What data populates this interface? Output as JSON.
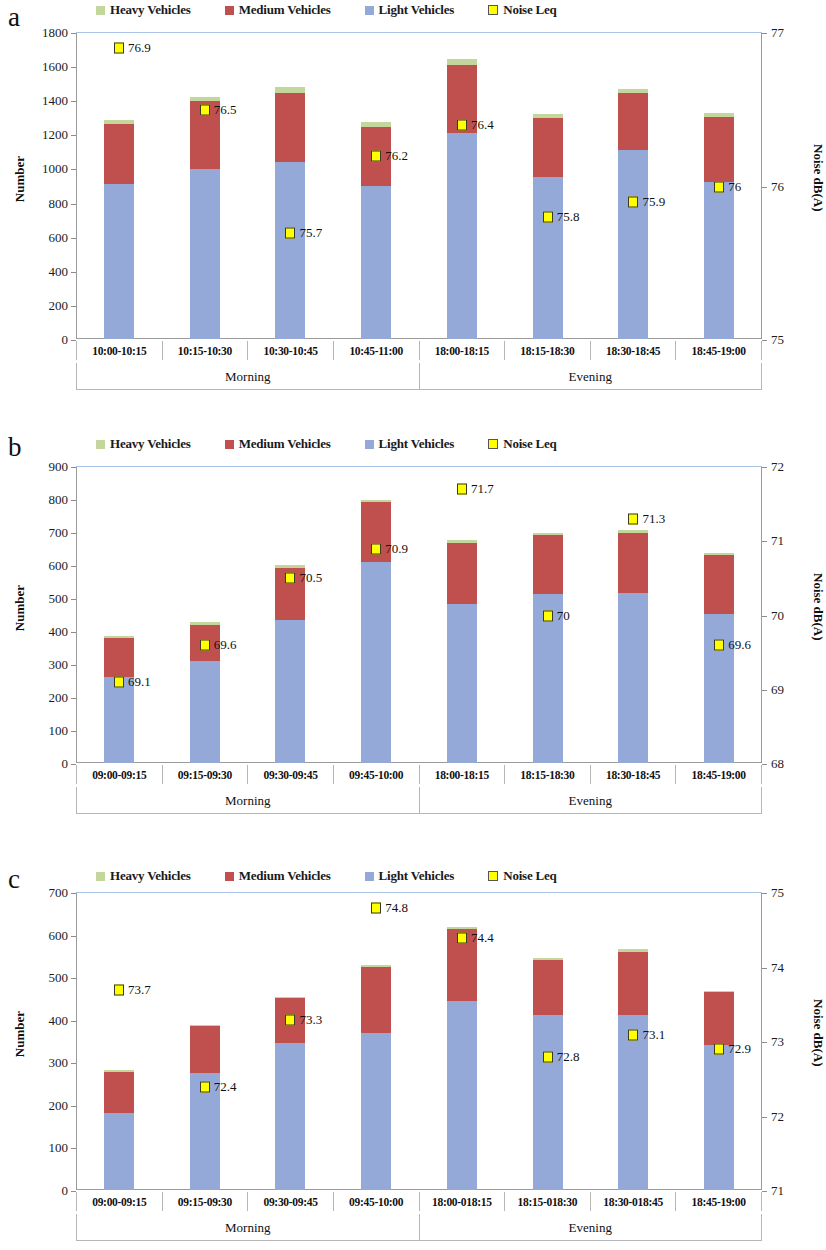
{
  "legend": {
    "items": [
      {
        "label": "Heavy Vehicles",
        "key": "heavy",
        "color": "#c3d69b"
      },
      {
        "label": "Medium Vehicles",
        "key": "medium",
        "color": "#c0504d"
      },
      {
        "label": "Light Vehicles",
        "key": "light",
        "color": "#95a9d8"
      },
      {
        "label": "Noise Leq",
        "key": "noise",
        "color": "#ffff00"
      }
    ]
  },
  "panels": [
    {
      "letter": "a"
    },
    {
      "letter": "b"
    },
    {
      "letter": "c"
    }
  ],
  "chart_data": [
    {
      "id": "a",
      "type": "bar",
      "title": "",
      "xlabel": "",
      "ylabel": "Number",
      "y2label": "Noise dB(A)",
      "ylim": [
        0,
        1800
      ],
      "yticks": [
        0,
        200,
        400,
        600,
        800,
        1000,
        1200,
        1400,
        1600,
        1800
      ],
      "y2lim": [
        75,
        77
      ],
      "y2ticks": [
        75,
        76,
        77
      ],
      "grid": false,
      "legend_position": "top",
      "groups": [
        {
          "name": "Morning",
          "span": 4
        },
        {
          "name": "Evening",
          "span": 4
        }
      ],
      "categories": [
        "10:00-10:15",
        "10:15-10:30",
        "10:30-10:45",
        "10:45-11:00",
        "18:00-18:15",
        "18:15-18:30",
        "18:30-18:45",
        "18:45-19:00"
      ],
      "series": [
        {
          "name": "Light Vehicles",
          "values": [
            910,
            995,
            1040,
            900,
            1205,
            950,
            1110,
            920
          ]
        },
        {
          "name": "Medium Vehicles",
          "values": [
            350,
            400,
            400,
            345,
            400,
            345,
            330,
            380
          ]
        },
        {
          "name": "Heavy Vehicles",
          "values": [
            25,
            25,
            35,
            30,
            35,
            25,
            25,
            25
          ]
        }
      ],
      "noise": {
        "name": "Noise Leq",
        "values": [
          76.9,
          76.5,
          75.7,
          76.2,
          76.4,
          75.8,
          75.9,
          76.0
        ],
        "labels": [
          "76.9",
          "76.5",
          "75.7",
          "76.2",
          "76.4",
          "75.8",
          "75.9",
          "76"
        ]
      }
    },
    {
      "id": "b",
      "type": "bar",
      "title": "",
      "xlabel": "",
      "ylabel": "Number",
      "y2label": "Noise dB(A)",
      "ylim": [
        0,
        900
      ],
      "yticks": [
        0,
        100,
        200,
        300,
        400,
        500,
        600,
        700,
        800,
        900
      ],
      "y2lim": [
        68,
        72
      ],
      "y2ticks": [
        68,
        69,
        70,
        71,
        72
      ],
      "grid": false,
      "legend_position": "top",
      "groups": [
        {
          "name": "Morning",
          "span": 4
        },
        {
          "name": "Evening",
          "span": 4
        }
      ],
      "categories": [
        "09:00-09:15",
        "09:15-09:30",
        "09:30-09:45",
        "09:45-10:00",
        "18:00-18:15",
        "18:15-18:30",
        "18:30-18:45",
        "18:45-19:00"
      ],
      "series": [
        {
          "name": "Light Vehicles",
          "values": [
            260,
            310,
            432,
            608,
            482,
            512,
            515,
            452
          ]
        },
        {
          "name": "Medium Vehicles",
          "values": [
            118,
            108,
            160,
            183,
            185,
            178,
            182,
            178
          ]
        },
        {
          "name": "Heavy Vehicles",
          "values": [
            6,
            8,
            7,
            5,
            8,
            8,
            8,
            6
          ]
        }
      ],
      "noise": {
        "name": "Noise Leq",
        "values": [
          69.1,
          69.6,
          70.5,
          70.9,
          71.7,
          70.0,
          71.3,
          69.6
        ],
        "labels": [
          "69.1",
          "69.6",
          "70.5",
          "70.9",
          "71.7",
          "70",
          "71.3",
          "69.6"
        ]
      }
    },
    {
      "id": "c",
      "type": "bar",
      "title": "",
      "xlabel": "",
      "ylabel": "Number",
      "y2label": "Noise dB(A)",
      "ylim": [
        0,
        700
      ],
      "yticks": [
        0,
        100,
        200,
        300,
        400,
        500,
        600,
        700
      ],
      "y2lim": [
        71,
        75
      ],
      "y2ticks": [
        71,
        72,
        73,
        74,
        75
      ],
      "grid": false,
      "legend_position": "top",
      "groups": [
        {
          "name": "Morning",
          "span": 4
        },
        {
          "name": "Evening",
          "span": 4
        }
      ],
      "categories": [
        "09:00-09:15",
        "09:15-09:30",
        "09:30-09:45",
        "09:45-10:00",
        "18:00-018:15",
        "18:15-018:30",
        "18:30-018:45",
        "18:45-19:00"
      ],
      "series": [
        {
          "name": "Light Vehicles",
          "values": [
            182,
            275,
            345,
            370,
            445,
            412,
            410,
            340
          ]
        },
        {
          "name": "Medium Vehicles",
          "values": [
            96,
            110,
            105,
            155,
            168,
            128,
            148,
            125
          ]
        },
        {
          "name": "Heavy Vehicles",
          "values": [
            5,
            3,
            3,
            3,
            4,
            6,
            8,
            3
          ]
        }
      ],
      "noise": {
        "name": "Noise Leq",
        "values": [
          73.7,
          72.4,
          73.3,
          74.8,
          74.4,
          72.8,
          73.1,
          72.9
        ],
        "labels": [
          "73.7",
          "72.4",
          "73.3",
          "74.8",
          "74.4",
          "72.8",
          "73.1",
          "72.9"
        ]
      }
    }
  ]
}
